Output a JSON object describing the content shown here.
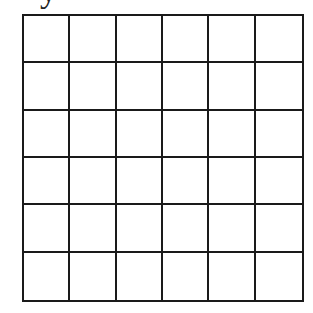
{
  "header": {
    "cropped_text": "y"
  },
  "grid": {
    "rows": 6,
    "columns": 6,
    "line_color": "#1a1a1a",
    "cell_color": "#ffffff"
  }
}
